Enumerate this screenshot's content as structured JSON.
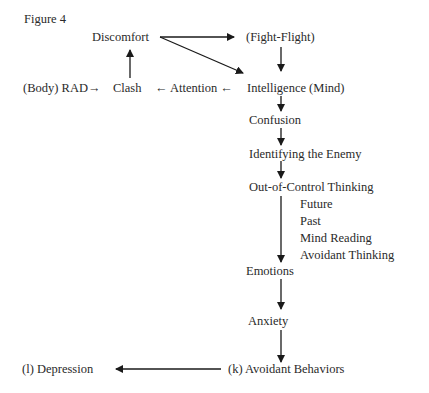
{
  "figure": {
    "title": "Figure 4",
    "nodes": {
      "discomfort": "Discomfort",
      "fight_flight": "(Fight-Flight)",
      "body_rad": "(Body) RAD→",
      "clash": "Clash",
      "attention": "← Attention ←",
      "intelligence": "Intelligence (Mind)",
      "confusion": "Confusion",
      "identifying_enemy": "Identifying the Enemy",
      "out_of_control": "Out-of-Control Thinking",
      "sub_items": [
        "Future",
        "Past",
        "Mind Reading",
        "Avoidant Thinking"
      ],
      "emotions": "Emotions",
      "anxiety": "Anxiety",
      "avoidant_behaviors": "(k) Avoidant Behaviors",
      "depression": "(l) Depression"
    },
    "edges": [
      [
        "Discomfort",
        "(Fight-Flight)"
      ],
      [
        "Discomfort",
        "Intelligence (Mind)"
      ],
      [
        "Clash",
        "Discomfort"
      ],
      [
        "(Body) RAD",
        "Clash"
      ],
      [
        "Attention",
        "Clash"
      ],
      [
        "Intelligence (Mind)",
        "Attention"
      ],
      [
        "(Fight-Flight)",
        "Intelligence (Mind)"
      ],
      [
        "Intelligence (Mind)",
        "Confusion"
      ],
      [
        "Confusion",
        "Identifying the Enemy"
      ],
      [
        "Identifying the Enemy",
        "Out-of-Control Thinking"
      ],
      [
        "Out-of-Control Thinking",
        "Emotions"
      ],
      [
        "Emotions",
        "Anxiety"
      ],
      [
        "Anxiety",
        "(k) Avoidant Behaviors"
      ],
      [
        "(k) Avoidant Behaviors",
        "(l) Depression"
      ]
    ],
    "line_color": "#1a1a1a"
  }
}
